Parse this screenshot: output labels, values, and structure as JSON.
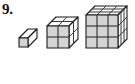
{
  "label": {
    "number": "9."
  },
  "figure": {
    "baseline_y": 48,
    "depth_dx": 9,
    "depth_dy": -9,
    "unit_cell_px": 11,
    "colors": {
      "front_face": "#d4d4d4",
      "top_face": "#fbfbfb",
      "side_face": "#fafafa",
      "outline": "#1a1a1a",
      "gridline": "#3a3a3a",
      "background": "#ffffff",
      "text": "#111111"
    },
    "cubes": [
      {
        "name": "cube-1x1x1",
        "order": 1,
        "edge_units": 1,
        "unit_cube_count": 1,
        "front_cols": 1,
        "front_rows": 1,
        "left_px": 17,
        "top_px": 27,
        "width_px": 22,
        "height_px": 22
      },
      {
        "name": "cube-2x2x2",
        "order": 2,
        "edge_units": 2,
        "unit_cube_count": 8,
        "front_cols": 2,
        "front_rows": 2,
        "left_px": 45,
        "top_px": 12,
        "width_px": 34,
        "height_px": 37
      },
      {
        "name": "cube-3x3x3",
        "order": 3,
        "edge_units": 3,
        "unit_cube_count": 27,
        "front_cols": 3,
        "front_rows": 3,
        "left_px": 83,
        "top_px": 0,
        "width_px": 45,
        "height_px": 49
      }
    ]
  }
}
